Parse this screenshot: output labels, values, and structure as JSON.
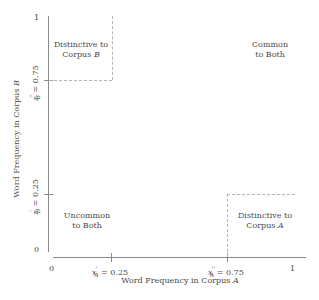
{
  "diagram": {
    "type": "quadrant",
    "x_axis": {
      "label_prefix": "Word Frequency in Corpus ",
      "label_var": "A",
      "ticks": [
        {
          "label": "0"
        },
        {
          "label_var": "x",
          "sub": "A",
          "sup": "'",
          "value": "= 0.25"
        },
        {
          "label_var": "x",
          "sub": "A",
          "sup": "''",
          "value": "= 0.75"
        },
        {
          "label": "1"
        }
      ]
    },
    "y_axis": {
      "label_prefix": "Word Frequency in Corpus ",
      "label_var": "B",
      "ticks": [
        {
          "label": "0"
        },
        {
          "label_var": "z",
          "sub": "B",
          "sup": "'",
          "value": "= 0.25"
        },
        {
          "label_var": "z",
          "sub": "B",
          "sup": "''",
          "value": "= 0.75"
        },
        {
          "label": "1"
        }
      ]
    },
    "regions": {
      "top_left": {
        "line1": "Distinctive to",
        "line2_prefix": "Corpus ",
        "line2_var": "B"
      },
      "top_right": {
        "line1": "Common",
        "line2": "to Both"
      },
      "bottom_left": {
        "line1": "Uncommon",
        "line2": "to Both"
      },
      "bottom_right": {
        "line1": "Distinctive to",
        "line2_prefix": "Corpus ",
        "line2_var": "A"
      }
    },
    "colors": {
      "axis": "#8a8a8a",
      "dashed": "#b5b5b5",
      "text": "#4a4a4a"
    }
  }
}
